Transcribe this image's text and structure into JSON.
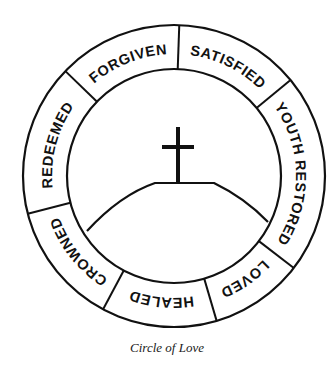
{
  "diagram": {
    "title": "Circle of Love",
    "center": [
      174,
      176
    ],
    "outer_radius": 151,
    "inner_radius": 107,
    "text_radius": 122,
    "line_color": "#111111",
    "segments": [
      {
        "label": "FORGIVEN",
        "start_deg": -136,
        "end_deg": -88
      },
      {
        "label": "SATISFIED",
        "start_deg": -88,
        "end_deg": -39.5
      },
      {
        "label": "YOUTH RESTORED",
        "start_deg": -39.5,
        "end_deg": 37.5
      },
      {
        "label": "LOVED",
        "start_deg": 37.5,
        "end_deg": 73.6
      },
      {
        "label": "HEALED",
        "start_deg": 73.6,
        "end_deg": 118
      },
      {
        "label": "CROWNED",
        "start_deg": 118,
        "end_deg": 165.5
      },
      {
        "label": "REDEEMED",
        "start_deg": 165.5,
        "end_deg": 224
      }
    ],
    "center_image": {
      "cross": "cross-icon",
      "hill": "hill-shape"
    }
  },
  "caption": "Circle of Love"
}
